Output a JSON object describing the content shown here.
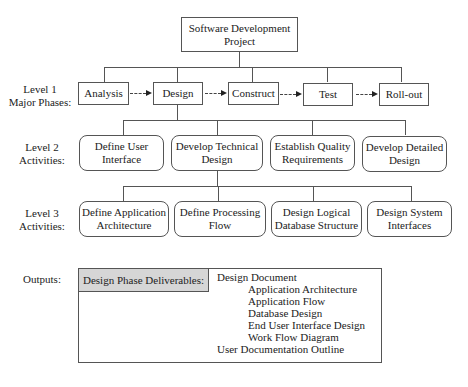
{
  "root": {
    "label_line1": "Software Development",
    "label_line2": "Project"
  },
  "level_labels": {
    "level1": {
      "line1": "Level 1",
      "line2": "Major Phases:"
    },
    "level2": {
      "line1": "Level 2",
      "line2": "Activities:"
    },
    "level3": {
      "line1": "Level 3",
      "line2": "Activities:"
    },
    "outputs": "Outputs:"
  },
  "level1": {
    "phases": [
      "Analysis",
      "Design",
      "Construct",
      "Test",
      "Roll-out"
    ]
  },
  "level2": {
    "activities": [
      {
        "line1": "Define User",
        "line2": "Interface"
      },
      {
        "line1": "Develop Technical",
        "line2": "Design"
      },
      {
        "line1": "Establish Quality",
        "line2": "Requirements"
      },
      {
        "line1": "Develop Detailed",
        "line2": "Design"
      }
    ]
  },
  "level3": {
    "activities": [
      {
        "line1": "Define Application",
        "line2": "Architecture"
      },
      {
        "line1": "Define Processing",
        "line2": "Flow"
      },
      {
        "line1": "Design Logical",
        "line2": "Database Structure"
      },
      {
        "line1": "Design System",
        "line2": "Interfaces"
      }
    ]
  },
  "outputs": {
    "header": "Design Phase Deliverables:",
    "items": [
      "Design Document",
      "Application Architecture",
      "Application Flow",
      "Database Design",
      "End User Interface Design",
      "Work Flow Diagram",
      "User Documentation Outline"
    ]
  }
}
